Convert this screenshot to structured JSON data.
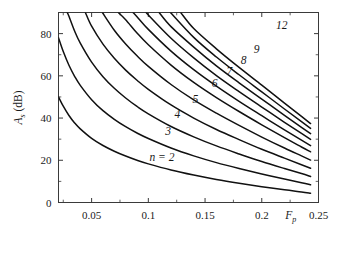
{
  "chart_data": {
    "type": "line",
    "title": "",
    "subtitle": "",
    "xlabel": "F_p",
    "xlabel_plain": "Fp",
    "ylabel": "A_s (dB)",
    "ylabel_plain": "As (dB)",
    "xlim": [
      0.0208,
      0.25
    ],
    "ylim": [
      0,
      90
    ],
    "xticks": [
      0.05,
      0.1,
      0.15,
      0.2,
      0.25
    ],
    "xticklabels": [
      "0.05",
      "0.1",
      "0.15",
      "0.2",
      "0.25"
    ],
    "yticks": [
      0,
      20,
      40,
      60,
      80
    ],
    "yticklabels": [
      "0",
      "20",
      "40",
      "60",
      "80"
    ],
    "xminor_ticks": [
      0.025,
      0.075,
      0.125,
      0.175,
      0.225
    ],
    "yminor_ticks": [
      10,
      30,
      50,
      70
    ],
    "grid": false,
    "legend": "none",
    "line_color": "#111111",
    "axis_color": "#3a3a3a",
    "background": "#ffffff",
    "series": [
      {
        "name": "n = 2",
        "n": 2,
        "label": "n = 2",
        "label_x": 0.112,
        "label_y": 19.5,
        "points": [
          [
            0.0208,
            50.0
          ],
          [
            0.025,
            45.6
          ],
          [
            0.03,
            41.2
          ],
          [
            0.035,
            37.7
          ],
          [
            0.04,
            34.9
          ],
          [
            0.05,
            30.4
          ],
          [
            0.06,
            27.0
          ],
          [
            0.07,
            24.3
          ],
          [
            0.08,
            22.0
          ],
          [
            0.09,
            20.0
          ],
          [
            0.1,
            18.3
          ],
          [
            0.12,
            15.4
          ],
          [
            0.14,
            13.0
          ],
          [
            0.16,
            10.9
          ],
          [
            0.18,
            9.1
          ],
          [
            0.2,
            7.5
          ],
          [
            0.22,
            6.0
          ],
          [
            0.235,
            5.0
          ],
          [
            0.243,
            4.4
          ]
        ]
      },
      {
        "name": "3",
        "n": 3,
        "label": "3",
        "label_x": 0.1175,
        "label_y": 31.8,
        "points": [
          [
            0.0208,
            78.0
          ],
          [
            0.025,
            71.5
          ],
          [
            0.03,
            65.0
          ],
          [
            0.035,
            59.8
          ],
          [
            0.04,
            55.5
          ],
          [
            0.05,
            48.7
          ],
          [
            0.06,
            43.5
          ],
          [
            0.07,
            39.4
          ],
          [
            0.08,
            35.9
          ],
          [
            0.09,
            32.9
          ],
          [
            0.1,
            30.3
          ],
          [
            0.12,
            25.8
          ],
          [
            0.14,
            22.1
          ],
          [
            0.16,
            18.9
          ],
          [
            0.18,
            16.1
          ],
          [
            0.2,
            13.5
          ],
          [
            0.22,
            11.1
          ],
          [
            0.235,
            9.4
          ],
          [
            0.243,
            8.4
          ]
        ]
      },
      {
        "name": "4",
        "n": 4,
        "label": "4",
        "label_x": 0.1255,
        "label_y": 39.8,
        "points": [
          [
            0.0285,
            90.0
          ],
          [
            0.03,
            88.2
          ],
          [
            0.035,
            81.2
          ],
          [
            0.04,
            75.5
          ],
          [
            0.05,
            66.5
          ],
          [
            0.06,
            59.6
          ],
          [
            0.07,
            54.1
          ],
          [
            0.08,
            49.5
          ],
          [
            0.09,
            45.5
          ],
          [
            0.1,
            42.0
          ],
          [
            0.12,
            36.0
          ],
          [
            0.14,
            31.1
          ],
          [
            0.16,
            26.8
          ],
          [
            0.18,
            23.0
          ],
          [
            0.2,
            19.4
          ],
          [
            0.22,
            16.1
          ],
          [
            0.235,
            13.7
          ],
          [
            0.243,
            12.3
          ]
        ]
      },
      {
        "name": "5",
        "n": 5,
        "label": "5",
        "label_x": 0.1415,
        "label_y": 47.2,
        "points": [
          [
            0.0445,
            90.0
          ],
          [
            0.05,
            83.5
          ],
          [
            0.06,
            75.0
          ],
          [
            0.07,
            68.3
          ],
          [
            0.08,
            62.7
          ],
          [
            0.09,
            57.9
          ],
          [
            0.1,
            53.6
          ],
          [
            0.12,
            46.2
          ],
          [
            0.14,
            40.0
          ],
          [
            0.16,
            34.6
          ],
          [
            0.18,
            29.8
          ],
          [
            0.2,
            25.2
          ],
          [
            0.22,
            21.0
          ],
          [
            0.235,
            17.9
          ],
          [
            0.243,
            16.2
          ]
        ]
      },
      {
        "name": "6",
        "n": 6,
        "label": "6",
        "label_x": 0.1585,
        "label_y": 54.5,
        "points": [
          [
            0.0595,
            90.0
          ],
          [
            0.07,
            81.6
          ],
          [
            0.08,
            75.1
          ],
          [
            0.09,
            69.5
          ],
          [
            0.1,
            64.5
          ],
          [
            0.12,
            55.9
          ],
          [
            0.14,
            48.6
          ],
          [
            0.16,
            42.3
          ],
          [
            0.18,
            36.5
          ],
          [
            0.2,
            31.0
          ],
          [
            0.22,
            25.8
          ],
          [
            0.235,
            22.1
          ],
          [
            0.243,
            20.1
          ]
        ]
      },
      {
        "name": "7",
        "n": 7,
        "label": "7",
        "label_x": 0.1715,
        "label_y": 60.4,
        "points": [
          [
            0.0735,
            90.0
          ],
          [
            0.08,
            86.6
          ],
          [
            0.09,
            80.3
          ],
          [
            0.1,
            74.7
          ],
          [
            0.12,
            65.1
          ],
          [
            0.14,
            56.9
          ],
          [
            0.16,
            49.7
          ],
          [
            0.18,
            43.1
          ],
          [
            0.2,
            36.8
          ],
          [
            0.22,
            30.7
          ],
          [
            0.235,
            26.3
          ],
          [
            0.243,
            24.0
          ]
        ]
      },
      {
        "name": "8",
        "n": 8,
        "label": "8",
        "label_x": 0.184,
        "label_y": 65.8,
        "points": [
          [
            0.0865,
            90.0
          ],
          [
            0.09,
            88.0
          ],
          [
            0.1,
            82.0
          ],
          [
            0.12,
            71.7
          ],
          [
            0.14,
            62.9
          ],
          [
            0.16,
            55.1
          ],
          [
            0.18,
            47.9
          ],
          [
            0.2,
            41.1
          ],
          [
            0.22,
            34.4
          ],
          [
            0.235,
            29.5
          ],
          [
            0.243,
            26.9
          ]
        ]
      },
      {
        "name": "9",
        "n": 9,
        "label": "9",
        "label_x": 0.1955,
        "label_y": 70.8,
        "points": [
          [
            0.0985,
            90.0
          ],
          [
            0.1,
            88.8
          ],
          [
            0.12,
            77.8
          ],
          [
            0.14,
            68.5
          ],
          [
            0.16,
            60.1
          ],
          [
            0.18,
            52.5
          ],
          [
            0.2,
            45.2
          ],
          [
            0.22,
            38.0
          ],
          [
            0.235,
            32.7
          ],
          [
            0.243,
            29.9
          ]
        ]
      },
      {
        "name": "10",
        "n": 10,
        "label": "",
        "label_x": null,
        "label_y": null,
        "points": [
          [
            0.1095,
            90.0
          ],
          [
            0.12,
            83.3
          ],
          [
            0.14,
            73.6
          ],
          [
            0.16,
            64.7
          ],
          [
            0.18,
            56.7
          ],
          [
            0.2,
            49.0
          ],
          [
            0.22,
            41.3
          ],
          [
            0.235,
            35.6
          ],
          [
            0.243,
            32.6
          ]
        ]
      },
      {
        "name": "11",
        "n": 11,
        "label": "",
        "label_x": null,
        "label_y": null,
        "points": [
          [
            0.1195,
            90.0
          ],
          [
            0.14,
            78.2
          ],
          [
            0.16,
            68.9
          ],
          [
            0.18,
            60.5
          ],
          [
            0.2,
            52.4
          ],
          [
            0.22,
            44.3
          ],
          [
            0.235,
            38.3
          ],
          [
            0.243,
            35.1
          ]
        ]
      },
      {
        "name": "12",
        "n": 12,
        "label": "12",
        "label_x": 0.2175,
        "label_y": 82.0,
        "points": [
          [
            0.1285,
            90.0
          ],
          [
            0.14,
            82.4
          ],
          [
            0.16,
            72.8
          ],
          [
            0.18,
            64.0
          ],
          [
            0.2,
            55.6
          ],
          [
            0.22,
            47.1
          ],
          [
            0.235,
            40.8
          ],
          [
            0.243,
            37.4
          ]
        ]
      }
    ],
    "annotations": [
      {
        "text": "n = 2",
        "x": 0.112,
        "y": 19.5
      },
      {
        "text": "3",
        "x": 0.1175,
        "y": 31.8
      },
      {
        "text": "4",
        "x": 0.1255,
        "y": 39.8
      },
      {
        "text": "5",
        "x": 0.1415,
        "y": 47.2
      },
      {
        "text": "6",
        "x": 0.1585,
        "y": 54.5
      },
      {
        "text": "7",
        "x": 0.1715,
        "y": 60.4
      },
      {
        "text": "8",
        "x": 0.184,
        "y": 65.8
      },
      {
        "text": "9",
        "x": 0.1955,
        "y": 70.8
      },
      {
        "text": "12",
        "x": 0.2175,
        "y": 82.0
      }
    ]
  }
}
